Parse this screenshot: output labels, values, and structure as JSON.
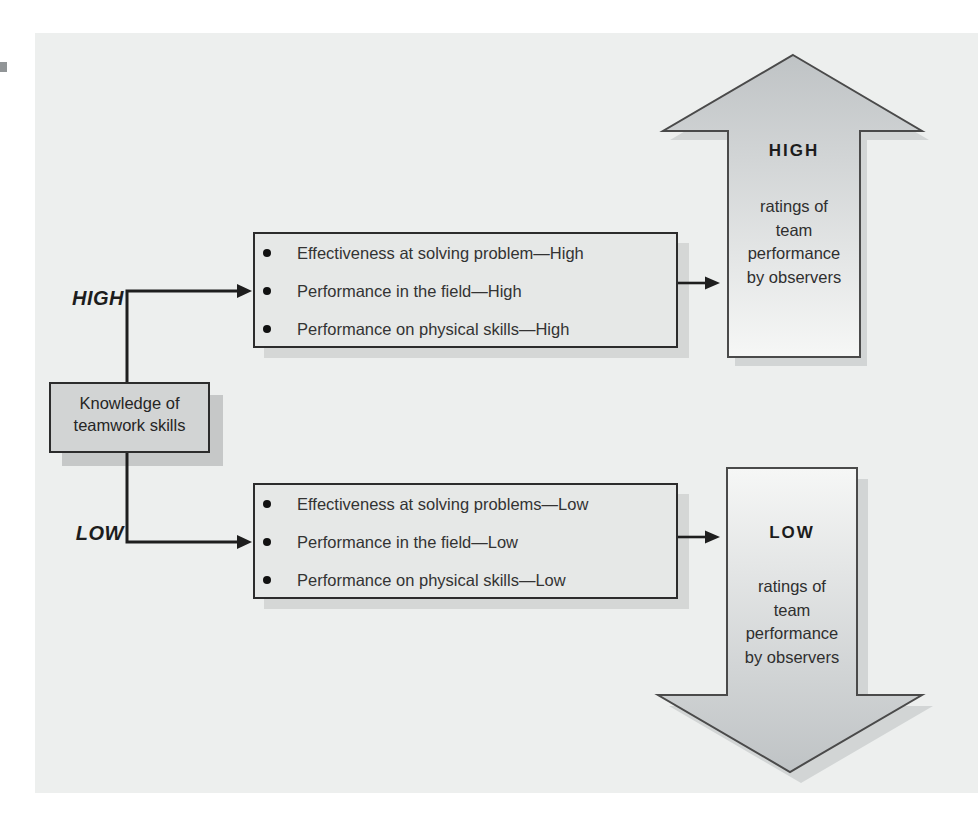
{
  "source_box": {
    "label": "Knowledge of teamwork skills"
  },
  "high_branch": {
    "level_label": "HIGH",
    "items": [
      "Effectiveness at solving problem—High",
      "Performance in the field—High",
      "Performance on physical skills—High"
    ],
    "arrow": {
      "direction": "up",
      "heading": "HIGH",
      "caption_lines": [
        "ratings of",
        "team",
        "performance",
        "by observers"
      ]
    }
  },
  "low_branch": {
    "level_label": "LOW",
    "items": [
      "Effectiveness at solving problems—Low",
      "Performance in the field—Low",
      "Performance on physical skills—Low"
    ],
    "arrow": {
      "direction": "down",
      "heading": "LOW",
      "caption_lines": [
        "ratings of",
        "team",
        "performance",
        "by observers"
      ]
    }
  },
  "colors": {
    "page_background": "#ffffff",
    "panel_background": "#edefee",
    "knowledge_box_fill": "#d2d4d4",
    "bullet_box_fill": "#e6e8e7",
    "box_border": "#2c2c2c",
    "arrow_gradient_dark": "#bfc3c5",
    "arrow_gradient_light": "#f6f7f6",
    "shadow": "#d3d6d5",
    "line": "#1e1e1e"
  }
}
